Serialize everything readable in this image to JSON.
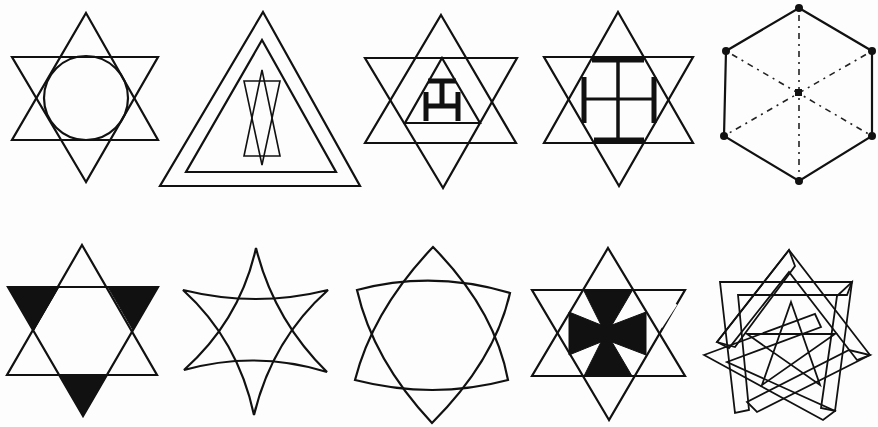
{
  "figure": {
    "kind": "symbol-plate",
    "ink_color": "#111111",
    "background_color": "#fdfdfd",
    "rows": [
      {
        "symbols": [
          {
            "id": "hexagram-with-circle",
            "description": "Hexagram with inscribed circle"
          },
          {
            "id": "double-triangle-with-hourglass",
            "description": "Nested triangles enclosing a narrow hexagram"
          },
          {
            "id": "hexagram-with-triangle-and-tau",
            "description": "Hexagram with inner triangle containing a triple tau"
          },
          {
            "id": "hexagram-with-quadruple-tau",
            "description": "Hexagram with four-armed tau cross"
          },
          {
            "id": "hexagon-with-radii",
            "description": "Hexagon with vertex dots and dotted radii"
          }
        ]
      },
      {
        "symbols": [
          {
            "id": "hexagram-alternating-filled",
            "description": "Hexagram with three filled points"
          },
          {
            "id": "concave-hexagram",
            "description": "Hexagram with inward-curved edges"
          },
          {
            "id": "convex-hexagram",
            "description": "Hexagram with outward-curved edges"
          },
          {
            "id": "hexagram-with-maltese-cross",
            "description": "Hexagram with filled cross"
          },
          {
            "id": "heptagram-with-pentagram",
            "description": "Interlaced heptagram enclosing a pentagram"
          }
        ]
      }
    ]
  }
}
